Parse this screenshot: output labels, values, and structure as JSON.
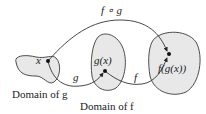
{
  "diagram": {
    "composition_label": "f ∘ g",
    "arrow_g_label": "g",
    "arrow_f_label": "f",
    "points": {
      "x": "x",
      "gx": "g(x)",
      "fgx": "f(g(x))"
    },
    "captions": {
      "domain_g": "Domain of g",
      "domain_f": "Domain of f"
    },
    "colors": {
      "blob_fill": "#e8e8e8",
      "stroke": "#333333",
      "point": "#111111"
    }
  }
}
